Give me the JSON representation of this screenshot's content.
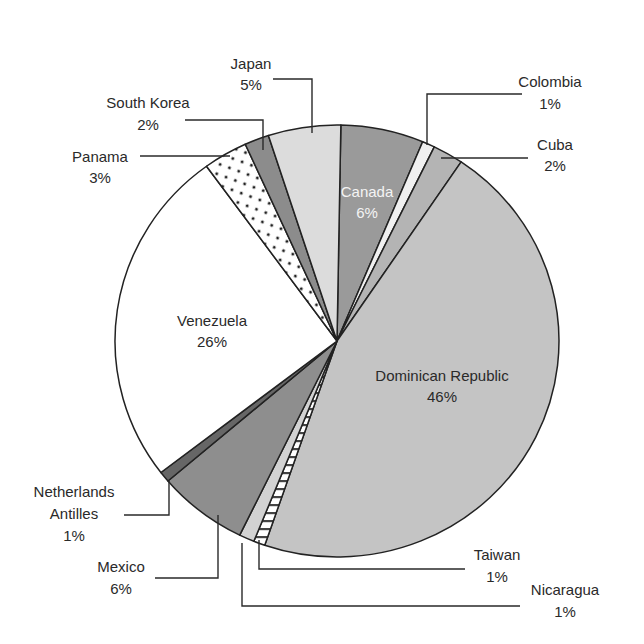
{
  "chart_data": {
    "type": "pie",
    "title": "",
    "start_angle_deg": 0,
    "direction": "clockwise",
    "slices": [
      {
        "label": "Canada",
        "value": 6,
        "pct": "6%",
        "start": 1,
        "end": 22.7,
        "fill": "#9a9a9a",
        "pattern": "solid",
        "text_color": "#f4f4f4"
      },
      {
        "label": "Colombia",
        "value": 1,
        "pct": "1%",
        "start": 22.7,
        "end": 26,
        "fill": "#f0f0f0",
        "pattern": "light"
      },
      {
        "label": "Cuba",
        "value": 2,
        "pct": "2%",
        "start": 26,
        "end": 34,
        "fill": "#b4b4b4",
        "pattern": "solid"
      },
      {
        "label": "Dominican Republic",
        "value": 46,
        "pct": "46%",
        "start": 34,
        "end": 199,
        "fill": "#c4c4c4",
        "pattern": "solid"
      },
      {
        "label": "Taiwan",
        "value": 1,
        "pct": "1%",
        "start": 199,
        "end": 202,
        "fill": "#ffffff",
        "pattern": "horizontal-stripes"
      },
      {
        "label": "Nicaragua",
        "value": 1,
        "pct": "1%",
        "start": 202,
        "end": 206,
        "fill": "#d2d2d2",
        "pattern": "solid"
      },
      {
        "label": "Mexico",
        "value": 6,
        "pct": "6%",
        "start": 206,
        "end": 229.6,
        "fill": "#8e8e8e",
        "pattern": "solid"
      },
      {
        "label": "Netherlands Antilles",
        "value": 1,
        "pct": "1%",
        "start": 229.6,
        "end": 232.5,
        "fill": "#666666",
        "pattern": "solid"
      },
      {
        "label": "Venezuela",
        "value": 26,
        "pct": "26%",
        "start": 232.5,
        "end": 324,
        "fill": "#ffffff",
        "pattern": "solid"
      },
      {
        "label": "Panama",
        "value": 3,
        "pct": "3%",
        "start": 324,
        "end": 335.6,
        "fill": "#ffffff",
        "pattern": "dots"
      },
      {
        "label": "South Korea",
        "value": 2,
        "pct": "2%",
        "start": 335.6,
        "end": 342,
        "fill": "#8c8c8c",
        "pattern": "solid"
      },
      {
        "label": "Japan",
        "value": 5,
        "pct": "5%",
        "start": 342,
        "end": 361,
        "fill": "#dcdcdc",
        "pattern": "solid"
      }
    ],
    "legend": "none (direct labels with leader lines)"
  },
  "labels": {
    "canada": {
      "name": "Canada",
      "pct": "6%"
    },
    "colombia": {
      "name": "Colombia",
      "pct": "1%"
    },
    "cuba": {
      "name": "Cuba",
      "pct": "2%"
    },
    "dominican_republic": {
      "name": "Dominican Republic",
      "pct": "46%"
    },
    "taiwan": {
      "name": "Taiwan",
      "pct": "1%"
    },
    "nicaragua": {
      "name": "Nicaragua",
      "pct": "1%"
    },
    "mexico": {
      "name": "Mexico",
      "pct": "6%"
    },
    "netherlands_antilles": {
      "name1": "Netherlands",
      "name2": "Antilles",
      "pct": "1%"
    },
    "venezuela": {
      "name": "Venezuela",
      "pct": "26%"
    },
    "panama": {
      "name": "Panama",
      "pct": "3%"
    },
    "south_korea": {
      "name": "South Korea",
      "pct": "2%"
    },
    "japan": {
      "name": "Japan",
      "pct": "5%"
    }
  }
}
